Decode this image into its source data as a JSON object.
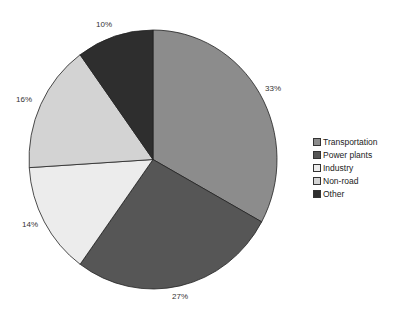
{
  "chart_data": {
    "type": "pie",
    "title": "",
    "categories": [
      "Transportation",
      "Power plants",
      "Industry",
      "Non-road",
      "Other"
    ],
    "values": [
      33,
      27,
      14,
      16,
      10
    ],
    "labels": [
      "33%",
      "27%",
      "14%",
      "16%",
      "10%"
    ],
    "colors": [
      "#8c8c8c",
      "#565656",
      "#ececec",
      "#d3d3d3",
      "#2e2e2e"
    ],
    "start_angle": "12 o'clock, clockwise",
    "legend_position": "right"
  },
  "legend": {
    "items": [
      {
        "label": "Transportation",
        "color": "#8c8c8c"
      },
      {
        "label": "Power plants",
        "color": "#565656"
      },
      {
        "label": "Industry",
        "color": "#ececec"
      },
      {
        "label": "Non-road",
        "color": "#d3d3d3"
      },
      {
        "label": "Other",
        "color": "#2e2e2e"
      }
    ]
  }
}
